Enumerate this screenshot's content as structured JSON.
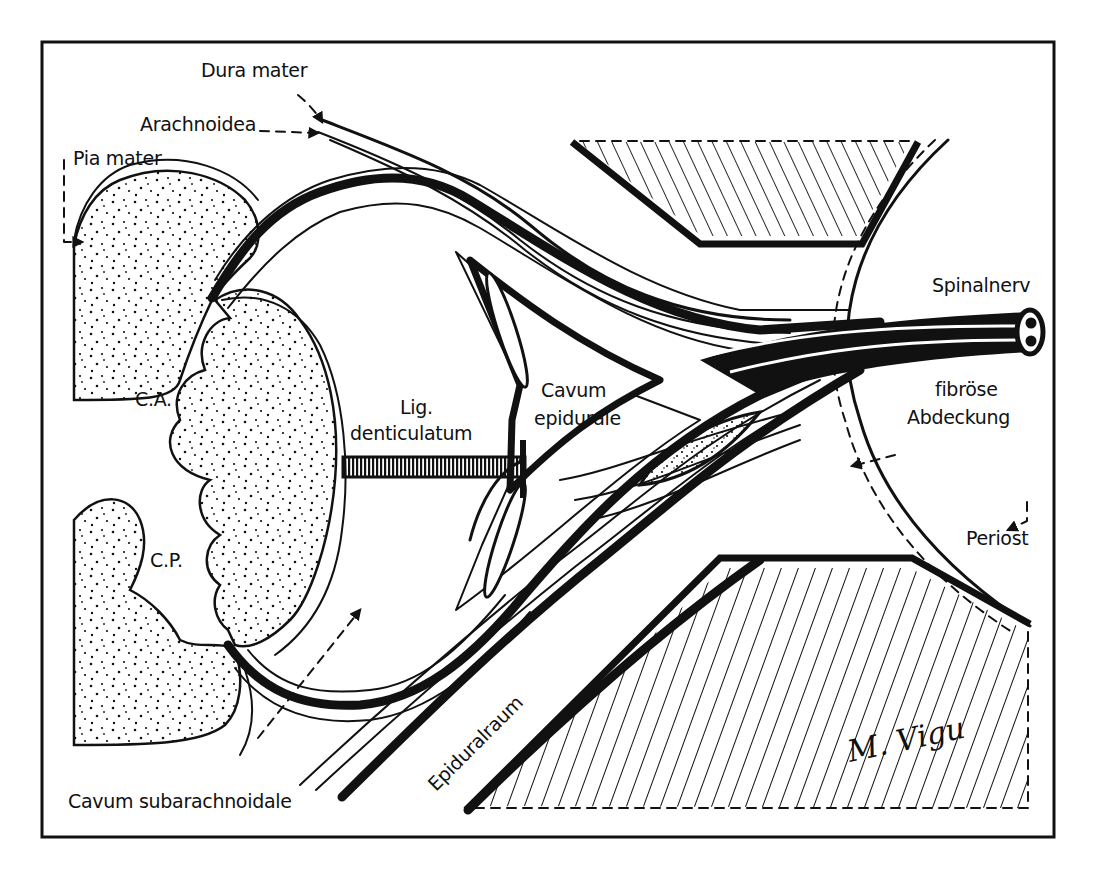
{
  "figure": {
    "type": "anatomical-diagram",
    "background": "#ffffff",
    "ink": "#111111"
  },
  "labels": {
    "dura_mater": "Dura mater",
    "arachnoidea": "Arachnoidea",
    "pia_mater": "Pia mater",
    "spinalnerv": "Spinalnerv",
    "fibrose_line1": "fibröse",
    "fibrose_line2": "Abdeckung",
    "ca": "C.A.",
    "cp": "C.P.",
    "lig_line1": "Lig.",
    "lig_line2": "denticulatum",
    "cavum_epi_line1": "Cavum",
    "cavum_epi_line2": "epidurale",
    "periost": "Periost",
    "epiduralraum": "Epiduralraum",
    "cavum_subarachnoidale": "Cavum subarachnoidale",
    "signature": "M. Vigu"
  }
}
